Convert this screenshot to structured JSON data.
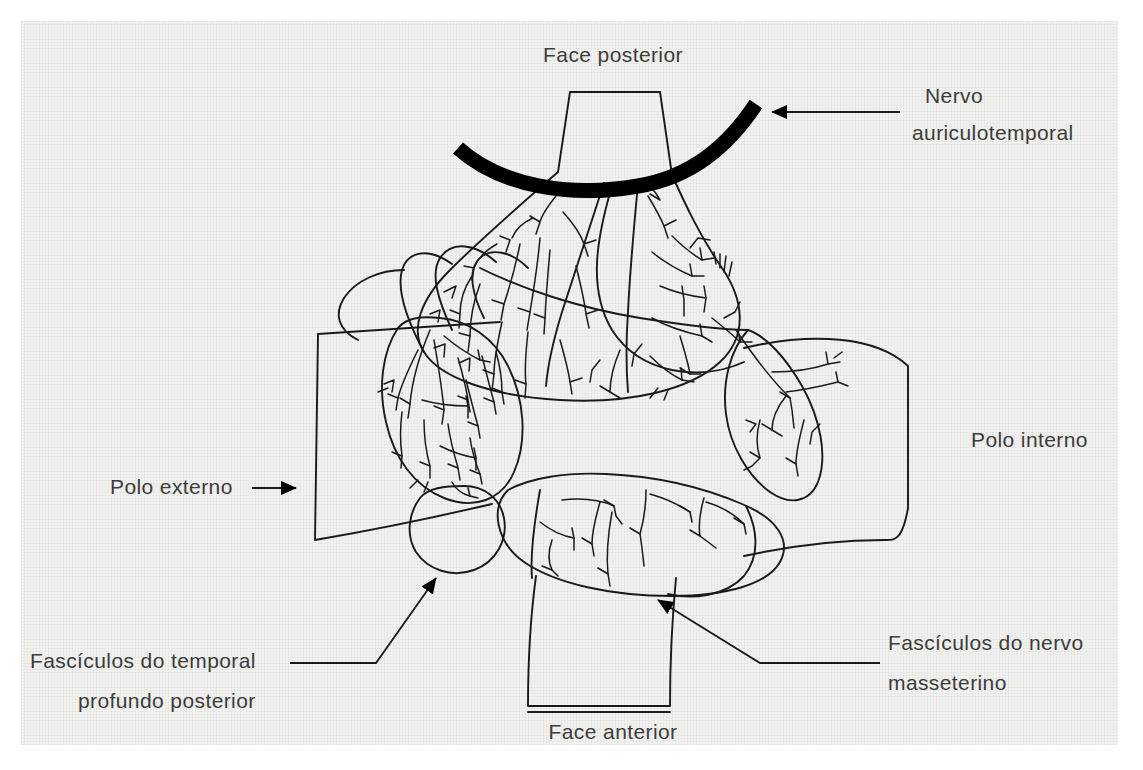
{
  "figure": {
    "background_color": "#f2f2f0",
    "page_color": "#ffffff",
    "ink_color": "#1a1a1a",
    "text_color": "#3c3c3c",
    "nerve_band_color": "#000000",
    "width": 1143,
    "height": 770
  },
  "labels": [
    {
      "id": "face-posterior",
      "lines": [
        "Face posterior"
      ],
      "x": 613,
      "y": 62,
      "anchor": "middle",
      "has_leader": false,
      "has_arrow": false
    },
    {
      "id": "nervo-auriculotemporal",
      "lines": [
        "Nervo",
        "auriculotemporal"
      ],
      "x": 925,
      "y": 103,
      "anchor": "start",
      "has_leader": true,
      "has_arrow": true
    },
    {
      "id": "polo-interno",
      "lines": [
        "Polo interno"
      ],
      "x": 971,
      "y": 447,
      "anchor": "start",
      "has_leader": false,
      "has_arrow": false
    },
    {
      "id": "polo-externo",
      "lines": [
        "Polo externo"
      ],
      "x": 110,
      "y": 494,
      "anchor": "start",
      "has_leader": true,
      "has_arrow": true
    },
    {
      "id": "fasciculos-temporal-profundo-posterior",
      "lines": [
        "Fascículos do temporal",
        "profundo posterior"
      ],
      "x": 30,
      "y": 668,
      "anchor": "start",
      "has_leader": true,
      "has_arrow": true
    },
    {
      "id": "fasciculos-nervo-masseterino",
      "lines": [
        "Fascículos do nervo",
        "masseterino"
      ],
      "x": 888,
      "y": 650,
      "anchor": "start",
      "has_leader": true,
      "has_arrow": true
    },
    {
      "id": "face-anterior",
      "lines": [
        "Face anterior"
      ],
      "x": 613,
      "y": 739,
      "anchor": "middle",
      "has_leader": false,
      "has_arrow": false
    }
  ],
  "structures": [
    {
      "id": "posterior-stalk",
      "name": "Face posterior stalk"
    },
    {
      "id": "posterior-belly",
      "name": "Posterior bulbous belly with dense nerve arborization"
    },
    {
      "id": "auriculotemporal-nerve-band",
      "name": "Thick black curved auriculotemporal nerve"
    },
    {
      "id": "external-pole-flap",
      "name": "Polo externo quadrilateral flap"
    },
    {
      "id": "external-pole-mass",
      "name": "Polo externo oval mass with dense branching"
    },
    {
      "id": "internal-pole-flap",
      "name": "Polo interno quadrilateral flap"
    },
    {
      "id": "internal-pole-mass",
      "name": "Polo interno oval mass with sparse branching"
    },
    {
      "id": "anterior-belly",
      "name": "Face anterior belly with sparse branching"
    },
    {
      "id": "anterior-stalk",
      "name": "Face anterior stalk"
    },
    {
      "id": "temporal-profundo-lobule",
      "name": "Small lobule of fasciculos do temporal profundo posterior"
    }
  ]
}
